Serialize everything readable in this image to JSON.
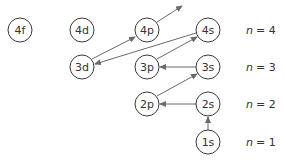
{
  "diagram": {
    "colors": {
      "background": "#ffffff",
      "circle_stroke": "#3a3a3a",
      "arrow": "#6a6a6a",
      "text": "#333333"
    },
    "orbitals": [
      {
        "id": "4f",
        "label": "4f",
        "cx": 20,
        "cy": 30
      },
      {
        "id": "4d",
        "label": "4d",
        "cx": 82,
        "cy": 30
      },
      {
        "id": "4p",
        "label": "4p",
        "cx": 147,
        "cy": 30
      },
      {
        "id": "4s",
        "label": "4s",
        "cx": 208,
        "cy": 30
      },
      {
        "id": "3d",
        "label": "3d",
        "cx": 82,
        "cy": 67
      },
      {
        "id": "3p",
        "label": "3p",
        "cx": 147,
        "cy": 67
      },
      {
        "id": "3s",
        "label": "3s",
        "cx": 208,
        "cy": 67
      },
      {
        "id": "2p",
        "label": "2p",
        "cx": 147,
        "cy": 104
      },
      {
        "id": "2s",
        "label": "2s",
        "cx": 208,
        "cy": 104
      },
      {
        "id": "1s",
        "label": "1s",
        "cx": 208,
        "cy": 142
      }
    ],
    "arrows": [
      {
        "from": "1s",
        "to": "2s"
      },
      {
        "from": "2s",
        "to": "2p"
      },
      {
        "from": "2p",
        "to": "3s"
      },
      {
        "from": "3s",
        "to": "3p"
      },
      {
        "from": "3p",
        "to": "4s"
      },
      {
        "from": "4s",
        "to": "3d"
      },
      {
        "from": "3d",
        "to": "4p"
      },
      {
        "from": "4p",
        "to": "next"
      }
    ],
    "shell_labels": [
      {
        "var": "n",
        "eq": "= 4",
        "y": 30
      },
      {
        "var": "n",
        "eq": "= 3",
        "y": 67
      },
      {
        "var": "n",
        "eq": "= 2",
        "y": 104
      },
      {
        "var": "n",
        "eq": "= 1",
        "y": 142
      }
    ]
  }
}
